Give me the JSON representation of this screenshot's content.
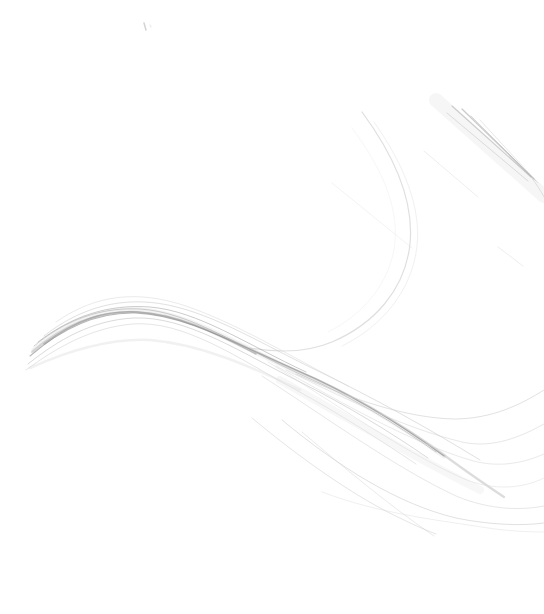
{
  "canvas": {
    "width": 544,
    "height": 614,
    "viewbox": "0 0 544 614",
    "background": "#ffffff"
  },
  "artwork": {
    "description": "Abstract generative line art: a fibrous bundle of fine gray strands sweeping in an S-curve from the left edge, cresting then fanning out toward the lower right; a large thin arc in the upper right; a cluster of dark diagonal strokes near the top-right corner; faint stray diagonals; tiny speck near top-left center. No text content.",
    "palette": {
      "background": "#ffffff",
      "darkest_strand": "#888888",
      "mid_strand": "#aaaaaa",
      "light_strand": "#cccccc",
      "haze": "#eeeeee"
    },
    "curves": [
      {
        "name": "speck-dash",
        "path": "M 144 23 L 146 30",
        "color": "#c0c0c0",
        "width": 1.5,
        "opacity": 0.7
      },
      {
        "name": "speck-dot",
        "path": "M 150 25 L 151 27",
        "color": "#dcdcdc",
        "width": 1.2,
        "opacity": 0.6
      },
      {
        "name": "topright-haze-band",
        "path": "M 436 100 L 544 196",
        "color": "#eeeeee",
        "width": 14,
        "opacity": 0.5
      },
      {
        "name": "topright-strand-1",
        "path": "M 452 106 L 531 177",
        "color": "#a8a8a8",
        "width": 1.1,
        "opacity": 0.55
      },
      {
        "name": "topright-strand-2",
        "path": "M 462 109 L 534 179",
        "color": "#999999",
        "width": 1.3,
        "opacity": 0.5
      },
      {
        "name": "topright-strand-3",
        "path": "M 447 113 L 528 181",
        "color": "#bfbfbf",
        "width": 1.0,
        "opacity": 0.5
      },
      {
        "name": "topright-strand-4",
        "path": "M 471 116 L 536 181",
        "color": "#b5b5b5",
        "width": 1.0,
        "opacity": 0.5
      },
      {
        "name": "topright-strand-5",
        "path": "M 480 120 L 538 183",
        "color": "#cccccc",
        "width": 0.9,
        "opacity": 0.5
      },
      {
        "name": "topright-tail",
        "path": "M 531 177 C 537 185 541 191 544 197",
        "color": "#c5c5c5",
        "width": 1.0,
        "opacity": 0.5
      },
      {
        "name": "faint-diagonal-mid",
        "path": "M 424 151 L 478 197",
        "color": "#e0e0e0",
        "width": 1.0,
        "opacity": 0.55
      },
      {
        "name": "faint-diagonal-left",
        "path": "M 332 183 L 412 248",
        "color": "#e8e8e8",
        "width": 1.0,
        "opacity": 0.5
      },
      {
        "name": "faint-diagonal-lower",
        "path": "M 498 247 L 523 266",
        "color": "#dddddd",
        "width": 1.0,
        "opacity": 0.5
      },
      {
        "name": "big-arc-main",
        "path": "M 362 112 C 396 158 414 204 410 244 C 405 290 374 324 332 342 C 304 354 274 352 250 348",
        "color": "#c9c9c9",
        "width": 1.2,
        "opacity": 0.6
      },
      {
        "name": "big-arc-echo",
        "path": "M 374 122 C 405 166 421 208 417 246 C 412 290 383 326 342 346",
        "color": "#e2e2e2",
        "width": 1.0,
        "opacity": 0.5
      },
      {
        "name": "big-arc-inner",
        "path": "M 352 128 C 382 168 398 206 395 242 C 391 282 364 314 328 332",
        "color": "#ededed",
        "width": 1.0,
        "opacity": 0.5
      },
      {
        "name": "bundle-halo-wide",
        "path": "M 34 350 C 66 324 100 308 140 310 C 190 313 238 346 302 374 C 356 398 402 426 444 456",
        "color": "#cfcfcf",
        "width": 5,
        "opacity": 0.25
      },
      {
        "name": "bundle-core-soft",
        "path": "M 32 352 C 62 326 96 311 136 312 C 188 314 236 344 300 372 C 356 396 404 426 448 458 C 474 477 492 489 504 497",
        "color": "#9a9a9a",
        "width": 2.2,
        "opacity": 0.35
      },
      {
        "name": "bundle-core-dark",
        "path": "M 30 356 C 60 330 95 312 135 313 C 185 315 232 342 296 370 C 352 394 400 424 444 456",
        "color": "#8a8a8a",
        "width": 1.1,
        "opacity": 0.6
      },
      {
        "name": "bundle-crest-dark",
        "path": "M 44 344 C 76 320 104 310 138 312 C 178 315 214 332 256 354",
        "color": "#888888",
        "width": 1.6,
        "opacity": 0.5
      },
      {
        "name": "bundle-strand-a",
        "path": "M 34 346 C 66 320 100 307 140 309 C 190 312 240 347 304 376 C 352 397 396 424 436 452",
        "color": "#a0a0a0",
        "width": 1.0,
        "opacity": 0.5
      },
      {
        "name": "bundle-strand-b",
        "path": "M 38 342 C 72 316 108 304 150 307 C 198 311 246 344 306 372",
        "color": "#949494",
        "width": 0.9,
        "opacity": 0.55
      },
      {
        "name": "bundle-strand-upper",
        "path": "M 44 336 C 82 306 124 296 168 305 C 216 315 262 344 316 370 C 372 397 428 428 480 460",
        "color": "#c2c2c2",
        "width": 1.0,
        "opacity": 0.5
      },
      {
        "name": "bundle-strand-top-halo",
        "path": "M 56 322 C 96 294 138 290 186 306 C 238 324 290 356 348 386",
        "color": "#d5d5d5",
        "width": 1.0,
        "opacity": 0.5
      },
      {
        "name": "bundle-strand-lower",
        "path": "M 28 364 C 58 340 92 320 134 318 C 186 316 240 352 300 382 C 348 406 390 432 428 458",
        "color": "#b5b5b5",
        "width": 1.0,
        "opacity": 0.5
      },
      {
        "name": "bundle-strand-lower-light",
        "path": "M 26 370 C 56 348 90 328 132 324 C 184 320 238 358 296 390 C 340 414 380 440 416 464",
        "color": "#cccccc",
        "width": 1.0,
        "opacity": 0.5
      },
      {
        "name": "bundle-underside-haze",
        "path": "M 30 368 C 70 350 110 338 150 340 C 200 344 250 366 300 390",
        "color": "#dddddd",
        "width": 2.5,
        "opacity": 0.4
      },
      {
        "name": "fan-haze-band",
        "path": "M 280 380 C 350 420 420 460 480 490",
        "color": "#e8e8e8",
        "width": 8,
        "opacity": 0.35
      },
      {
        "name": "fan-strand-rise-high",
        "path": "M 296 374 C 352 400 408 418 454 419 C 492 419 522 404 544 390",
        "color": "#c8c8c8",
        "width": 1.0,
        "opacity": 0.55
      },
      {
        "name": "fan-strand-rise-mid",
        "path": "M 286 370 C 344 398 404 428 462 442 C 494 449 522 436 544 424",
        "color": "#cfcfcf",
        "width": 1.0,
        "opacity": 0.5
      },
      {
        "name": "fan-strand-mid",
        "path": "M 276 366 C 344 404 410 442 470 460 C 500 469 526 462 544 454",
        "color": "#d4d4d4",
        "width": 1.0,
        "opacity": 0.5
      },
      {
        "name": "fan-strand-low-mid",
        "path": "M 268 362 C 336 404 404 452 462 478 C 494 492 524 488 544 478",
        "color": "#d8d8d8",
        "width": 1.0,
        "opacity": 0.45
      },
      {
        "name": "fan-strand-low",
        "path": "M 262 376 C 330 420 396 468 456 496 C 492 511 524 510 544 506",
        "color": "#cfcfcf",
        "width": 1.0,
        "opacity": 0.5
      },
      {
        "name": "fan-strand-flat-tail",
        "path": "M 282 420 C 340 468 398 504 456 518 C 490 525 522 526 544 523",
        "color": "#c8c8c8",
        "width": 1.0,
        "opacity": 0.55
      },
      {
        "name": "fan-strand-steep-tip",
        "path": "M 252 418 C 300 458 356 498 404 520 C 416 526 428 531 436 534",
        "color": "#cccccc",
        "width": 1.0,
        "opacity": 0.5
      },
      {
        "name": "fan-strand-steep-cross",
        "path": "M 302 432 C 342 466 390 506 434 536",
        "color": "#d0d0d0",
        "width": 0.9,
        "opacity": 0.5
      },
      {
        "name": "fan-strand-bottom-flat",
        "path": "M 322 492 C 380 514 438 520 488 528 C 508 531 528 532 544 532",
        "color": "#d8d8d8",
        "width": 0.9,
        "opacity": 0.45
      }
    ]
  }
}
